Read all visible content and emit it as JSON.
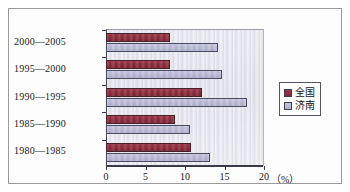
{
  "chart_data": {
    "type": "bar",
    "orientation": "horizontal",
    "title": "",
    "xlabel": "(%)",
    "ylabel": "",
    "categories": [
      "1980—1985",
      "1985—1990",
      "1990—1995",
      "1995—2000",
      "2000—2005"
    ],
    "series": [
      {
        "name": "全国",
        "color": "#8a2636",
        "values": [
          10.7,
          8.7,
          12.1,
          8.1,
          8.1
        ]
      },
      {
        "name": "济南",
        "color": "#b6b6d4",
        "values": [
          13.2,
          10.6,
          17.8,
          14.7,
          14.2
        ]
      }
    ],
    "xlim": [
      0,
      20
    ],
    "xticks": [
      0,
      5,
      10,
      15,
      20
    ],
    "xtick_labels": [
      "0",
      "5",
      "10",
      "15",
      "20"
    ],
    "grid": false,
    "legend_position": "right"
  },
  "axis": {
    "unit_label": "（%）"
  },
  "legend": {
    "items": [
      {
        "label": "全国"
      },
      {
        "label": "济南"
      }
    ]
  }
}
